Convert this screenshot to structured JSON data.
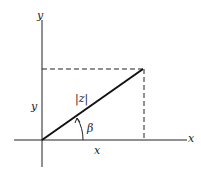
{
  "diagram": {
    "axes": {
      "x_label": "x",
      "y_label": "y"
    },
    "vector": {
      "label": "|z|"
    },
    "angle": {
      "label": "β"
    },
    "projections": {
      "x_component_label": "x",
      "y_component_label": "y"
    },
    "colors": {
      "ink": "#222222",
      "background": "#ffffff"
    }
  }
}
